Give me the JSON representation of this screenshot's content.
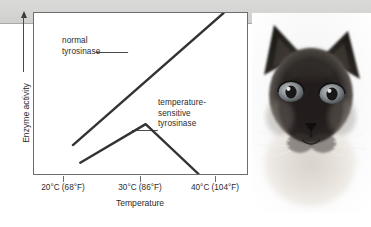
{
  "figure": {
    "name": "temperature-sensitive-tyrosinase-figure",
    "background_color": "#ffffff",
    "band_color": "#d6d6d4",
    "line_color": "#333333",
    "axis_color": "#6d6d6d"
  },
  "chart_data": {
    "type": "line",
    "title": "",
    "xlabel": "Temperature",
    "ylabel": "Enzyme activity",
    "grid": false,
    "legend_position": "inline-annotation",
    "xtick_labels": [
      "20°C (68°F)",
      "30°C (86°F)",
      "40°C (104°F)"
    ],
    "xtick_values": [
      20,
      30,
      40
    ],
    "ytick_labels": [],
    "xlim": [
      16,
      45
    ],
    "ylim": [
      0,
      100
    ],
    "series": [
      {
        "name": "normal tyrosinase",
        "label": "normal\ntyrosinase",
        "label_line1": "normal",
        "label_line2": "tyrosinase",
        "x": [
          21.3,
          41.8
        ],
        "y": [
          18,
          100
        ],
        "points": [
          [
            21.3,
            18
          ],
          [
            41.8,
            100
          ]
        ]
      },
      {
        "name": "temperature-sensitive tyrosinase",
        "label": "temperature-sensitive tyrosinase",
        "label_line1": "temperature-",
        "label_line2": "sensitive",
        "label_line3": "tyrosinase",
        "x": [
          22.3,
          31.2,
          38.4
        ],
        "y": [
          7,
          31,
          0
        ],
        "points": [
          [
            22.3,
            7
          ],
          [
            31.2,
            31
          ],
          [
            38.4,
            0
          ]
        ]
      }
    ]
  },
  "photo": {
    "name": "siamese-cat-photo",
    "subject": "Siamese cat",
    "alt": "Siamese cat with dark face, ears, and blue eyes"
  }
}
